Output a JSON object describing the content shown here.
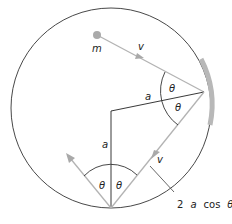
{
  "diagram": {
    "labels": {
      "mass": "m",
      "velocity_in": "v",
      "velocity_out": "v",
      "radius_top": "a",
      "radius_left": "a",
      "theta_top_upper": "θ",
      "theta_top_lower": "θ",
      "theta_bottom_left": "θ",
      "theta_bottom_right": "θ",
      "chord_length_num": "2",
      "chord_length_a": "a",
      "chord_length_cos": "cos",
      "chord_length_theta": "θ"
    },
    "colors": {
      "circle": "#333333",
      "path": "#b3b3b3",
      "mass": "#aaaaaa",
      "wall": "#b8b8b8",
      "radius": "#222222"
    }
  }
}
